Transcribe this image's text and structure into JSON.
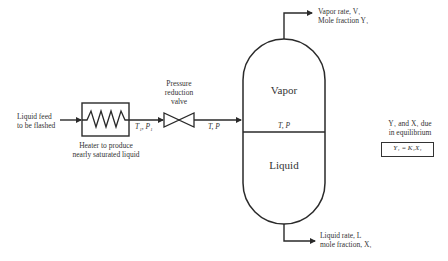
{
  "feed": {
    "label_line1": "Liquid feed",
    "label_line2": "to be flashed"
  },
  "heater": {
    "label_line1": "Heater to produce",
    "label_line2": "nearly saturated liquid",
    "outlet_state": "T₁, P₁"
  },
  "valve": {
    "label_line1": "Pressure",
    "label_line2": "reduction",
    "label_line3": "valve",
    "outlet_state": "T, P"
  },
  "vessel": {
    "vapor_label": "Vapor",
    "liquid_label": "Liquid",
    "interface_state": "T, P"
  },
  "vapor_outlet": {
    "line1": "Vapor rate, V₁",
    "line2": "Mole fraction Y₁"
  },
  "liquid_outlet": {
    "line1": "Liquid rate, L",
    "line2": "mole fraction, X₁"
  },
  "equilibrium": {
    "note_line1": "Y₁ and X₁ due",
    "note_line2": "in equilibrium",
    "equation": "Y₁ = K₁X₁"
  },
  "colors": {
    "line": "#2a2a2a",
    "text": "#333333",
    "background": "#ffffff"
  }
}
